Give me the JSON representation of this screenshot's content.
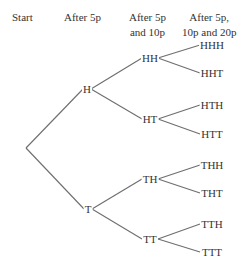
{
  "headers": {
    "start": "Start",
    "level1": "After 5p",
    "level2_line1": "After 5p",
    "level2_line2": "and 10p",
    "level3_line1": "After 5p,",
    "level3_line2": "10p and 20p"
  },
  "tree": {
    "root": {
      "label": "",
      "x": 26,
      "y": 148
    },
    "level1": [
      {
        "label": "H",
        "x": 87,
        "y": 89
      },
      {
        "label": "T",
        "x": 88,
        "y": 209
      }
    ],
    "level2": [
      {
        "label": "HH",
        "x": 150,
        "y": 58,
        "parent": 0
      },
      {
        "label": "HT",
        "x": 150,
        "y": 119,
        "parent": 0
      },
      {
        "label": "TH",
        "x": 150,
        "y": 179,
        "parent": 1
      },
      {
        "label": "TT",
        "x": 150,
        "y": 239,
        "parent": 1
      }
    ],
    "level3": [
      {
        "label": "HHH",
        "x": 212,
        "y": 45,
        "parent": 0
      },
      {
        "label": "HHT",
        "x": 212,
        "y": 73,
        "parent": 0
      },
      {
        "label": "HTH",
        "x": 212,
        "y": 105,
        "parent": 1
      },
      {
        "label": "HTT",
        "x": 212,
        "y": 134,
        "parent": 1
      },
      {
        "label": "THH",
        "x": 212,
        "y": 165,
        "parent": 2
      },
      {
        "label": "THT",
        "x": 212,
        "y": 193,
        "parent": 2
      },
      {
        "label": "TTH",
        "x": 212,
        "y": 224,
        "parent": 3
      },
      {
        "label": "TTT",
        "x": 212,
        "y": 252,
        "parent": 3
      }
    ]
  },
  "colors": {
    "edge": "#6e6e6e",
    "text": "#333333",
    "background": "#ffffff"
  }
}
